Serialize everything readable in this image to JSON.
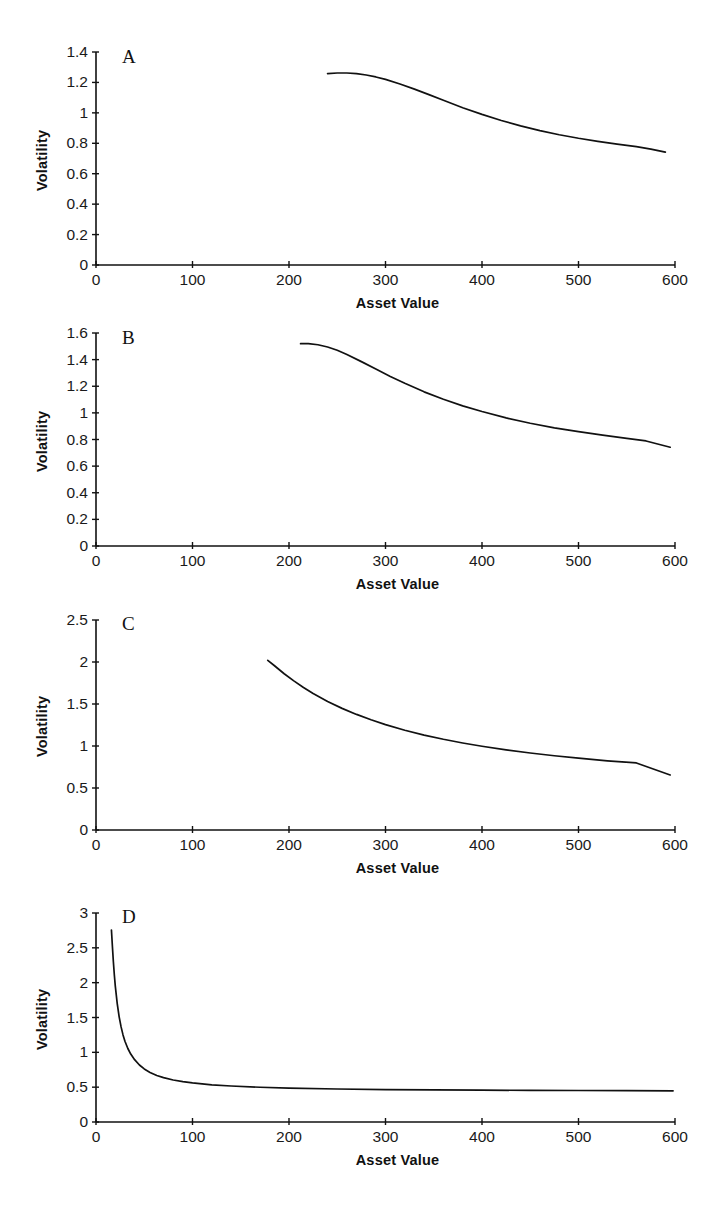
{
  "page": {
    "running_head": "",
    "background": "#ffffff",
    "ink": "#111111"
  },
  "figure": {
    "panel_count": 4,
    "shared_xlabel": "Asset Value",
    "shared_ylabel": "Volatility"
  },
  "chart_data": [
    {
      "type": "line",
      "panel": "A",
      "title": "",
      "xlabel": "Asset Value",
      "ylabel": "Volatility",
      "xlim": [
        0,
        600
      ],
      "ylim": [
        0,
        1.4
      ],
      "xticks": [
        0,
        100,
        200,
        300,
        400,
        500,
        600
      ],
      "xtick_labels": [
        "0",
        "100",
        "200",
        "300",
        "400",
        "500",
        "600"
      ],
      "yticks": [
        0,
        0.2,
        0.4,
        0.6,
        0.8,
        1,
        1.2,
        1.4
      ],
      "ytick_labels": [
        "0",
        "0.2",
        "0.4",
        "0.6",
        "0.8",
        "1",
        "1.2",
        "1.4"
      ],
      "grid": false,
      "legend": false,
      "series": [
        {
          "name": "volatility",
          "color": "#111111",
          "x": [
            240,
            250,
            260,
            270,
            280,
            290,
            300,
            315,
            330,
            345,
            360,
            380,
            400,
            420,
            440,
            460,
            480,
            500,
            520,
            540,
            560,
            575,
            590
          ],
          "y": [
            1.258,
            1.262,
            1.262,
            1.258,
            1.249,
            1.236,
            1.22,
            1.19,
            1.156,
            1.12,
            1.083,
            1.034,
            0.99,
            0.95,
            0.914,
            0.883,
            0.856,
            0.833,
            0.813,
            0.795,
            0.778,
            0.762,
            0.742
          ]
        }
      ]
    },
    {
      "type": "line",
      "panel": "B",
      "title": "",
      "xlabel": "Asset Value",
      "ylabel": "Volatility",
      "xlim": [
        0,
        600
      ],
      "ylim": [
        0,
        1.6
      ],
      "xticks": [
        0,
        100,
        200,
        300,
        400,
        500,
        600
      ],
      "xtick_labels": [
        "0",
        "100",
        "200",
        "300",
        "400",
        "500",
        "600"
      ],
      "yticks": [
        0,
        0.2,
        0.4,
        0.6,
        0.8,
        1,
        1.2,
        1.4,
        1.6
      ],
      "ytick_labels": [
        "0",
        "0.2",
        "0.4",
        "0.6",
        "0.8",
        "1",
        "1.2",
        "1.4",
        "1.6"
      ],
      "grid": false,
      "legend": false,
      "series": [
        {
          "name": "volatility",
          "color": "#111111",
          "x": [
            212,
            220,
            230,
            240,
            250,
            260,
            275,
            290,
            305,
            320,
            340,
            360,
            380,
            400,
            425,
            450,
            475,
            500,
            525,
            550,
            570,
            595
          ],
          "y": [
            1.52,
            1.52,
            1.512,
            1.495,
            1.47,
            1.438,
            1.385,
            1.33,
            1.274,
            1.222,
            1.158,
            1.102,
            1.053,
            1.01,
            0.962,
            0.922,
            0.888,
            0.859,
            0.833,
            0.808,
            0.789,
            0.742
          ]
        }
      ]
    },
    {
      "type": "line",
      "panel": "C",
      "title": "",
      "xlabel": "Asset Value",
      "ylabel": "Volatility",
      "xlim": [
        0,
        600
      ],
      "ylim": [
        0,
        2.5
      ],
      "xticks": [
        0,
        100,
        200,
        300,
        400,
        500,
        600
      ],
      "xtick_labels": [
        "0",
        "100",
        "200",
        "300",
        "400",
        "500",
        "600"
      ],
      "yticks": [
        0,
        0.5,
        1,
        1.5,
        2,
        2.5
      ],
      "ytick_labels": [
        "0",
        "0.5",
        "1",
        "1.5",
        "2",
        "2.5"
      ],
      "grid": false,
      "legend": false,
      "series": [
        {
          "name": "volatility",
          "color": "#111111",
          "x": [
            178,
            185,
            195,
            205,
            215,
            225,
            240,
            255,
            270,
            285,
            300,
            320,
            340,
            360,
            380,
            400,
            425,
            450,
            475,
            500,
            530,
            560,
            595
          ],
          "y": [
            2.02,
            1.955,
            1.86,
            1.775,
            1.697,
            1.625,
            1.53,
            1.448,
            1.376,
            1.312,
            1.255,
            1.188,
            1.13,
            1.08,
            1.036,
            0.997,
            0.954,
            0.917,
            0.884,
            0.855,
            0.824,
            0.798,
            0.655
          ]
        }
      ]
    },
    {
      "type": "line",
      "panel": "D",
      "title": "",
      "xlabel": "Asset Value",
      "ylabel": "Volatility",
      "xlim": [
        0,
        600
      ],
      "ylim": [
        0,
        3
      ],
      "xticks": [
        0,
        100,
        200,
        300,
        400,
        500,
        600
      ],
      "xtick_labels": [
        "0",
        "100",
        "200",
        "300",
        "400",
        "500",
        "600"
      ],
      "yticks": [
        0,
        0.5,
        1,
        1.5,
        2,
        2.5,
        3
      ],
      "ytick_labels": [
        "0",
        "0.5",
        "1",
        "1.5",
        "2",
        "2.5",
        "3"
      ],
      "grid": false,
      "legend": false,
      "series": [
        {
          "name": "volatility",
          "color": "#111111",
          "x": [
            16,
            17,
            18,
            19,
            20,
            22,
            24,
            26,
            28,
            30,
            33,
            36,
            40,
            45,
            50,
            56,
            63,
            70,
            80,
            90,
            100,
            120,
            140,
            170,
            200,
            250,
            300,
            350,
            400,
            450,
            500,
            550,
            598
          ],
          "y": [
            2.755,
            2.52,
            2.3,
            2.11,
            1.95,
            1.7,
            1.51,
            1.365,
            1.25,
            1.16,
            1.055,
            0.975,
            0.895,
            0.818,
            0.762,
            0.712,
            0.668,
            0.637,
            0.603,
            0.579,
            0.561,
            0.534,
            0.517,
            0.499,
            0.487,
            0.474,
            0.466,
            0.461,
            0.457,
            0.454,
            0.452,
            0.45,
            0.448
          ]
        }
      ]
    }
  ],
  "panels": [
    {
      "letter": "A",
      "ylabel": "Volatility",
      "xlabel": "Asset Value",
      "ytick_labels": [
        "1.4",
        "1.2",
        "1",
        "0.8",
        "0.6",
        "0.4",
        "0.2",
        "0"
      ],
      "xtick_labels": [
        "0",
        "100",
        "200",
        "300",
        "400",
        "500",
        "600"
      ]
    },
    {
      "letter": "B",
      "ylabel": "Volatility",
      "xlabel": "Asset Value",
      "ytick_labels": [
        "1.6",
        "1.4",
        "1.2",
        "1",
        "0.8",
        "0.6",
        "0.4",
        "0.2",
        "0"
      ],
      "xtick_labels": [
        "0",
        "100",
        "200",
        "300",
        "400",
        "500",
        "600"
      ]
    },
    {
      "letter": "C",
      "ylabel": "Volatility",
      "xlabel": "Asset Value",
      "ytick_labels": [
        "2.5",
        "2",
        "1.5",
        "1",
        "0.5",
        "0"
      ],
      "xtick_labels": [
        "0",
        "100",
        "200",
        "300",
        "400",
        "500",
        "600"
      ]
    },
    {
      "letter": "D",
      "ylabel": "Volatility",
      "xlabel": "Asset Value",
      "ytick_labels": [
        "3",
        "2.5",
        "2",
        "1.5",
        "1",
        "0.5",
        "0"
      ],
      "xtick_labels": [
        "0",
        "100",
        "200",
        "300",
        "400",
        "500",
        "600"
      ]
    }
  ]
}
